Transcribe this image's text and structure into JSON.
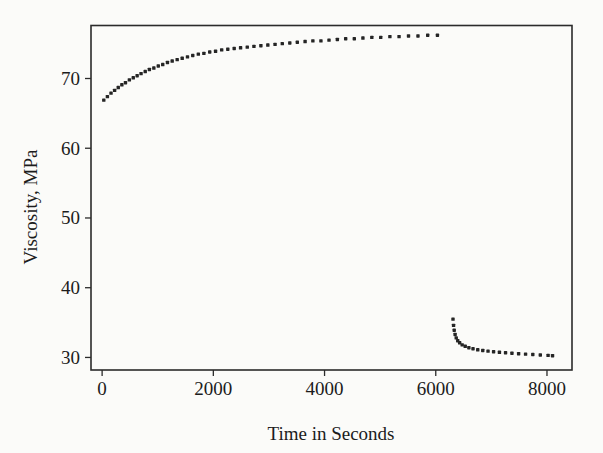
{
  "figure": {
    "background_color": "#fbfbf9",
    "ink_color": "#252525"
  },
  "chart_data": {
    "type": "scatter",
    "title": "",
    "xlabel": "Time in Seconds",
    "ylabel": "Viscosity, MPa",
    "xlim": [
      -200,
      8450
    ],
    "ylim": [
      28.2,
      77.6
    ],
    "xticks": [
      0,
      2000,
      4000,
      6000,
      8000
    ],
    "xtick_labels": [
      "0",
      "2000",
      "4000",
      "6000",
      "8000"
    ],
    "yticks": [
      30,
      40,
      50,
      60,
      70
    ],
    "ytick_labels": [
      "30",
      "40",
      "50",
      "60",
      "70"
    ],
    "grid": false,
    "legend": false,
    "marker": "square-dot",
    "series": [
      {
        "name": "rising-branch",
        "points": [
          [
            30,
            66.9
          ],
          [
            95,
            67.4
          ],
          [
            160,
            67.9
          ],
          [
            225,
            68.3
          ],
          [
            290,
            68.7
          ],
          [
            355,
            69.1
          ],
          [
            420,
            69.4
          ],
          [
            490,
            69.8
          ],
          [
            560,
            70.1
          ],
          [
            630,
            70.4
          ],
          [
            700,
            70.7
          ],
          [
            775,
            71.0
          ],
          [
            850,
            71.3
          ],
          [
            930,
            71.5
          ],
          [
            1010,
            71.8
          ],
          [
            1090,
            72.0
          ],
          [
            1175,
            72.3
          ],
          [
            1260,
            72.5
          ],
          [
            1350,
            72.7
          ],
          [
            1440,
            72.9
          ],
          [
            1535,
            73.1
          ],
          [
            1630,
            73.3
          ],
          [
            1730,
            73.5
          ],
          [
            1830,
            73.6
          ],
          [
            1935,
            73.8
          ],
          [
            2040,
            73.9
          ],
          [
            2150,
            74.1
          ],
          [
            2260,
            74.2
          ],
          [
            2375,
            74.3
          ],
          [
            2490,
            74.4
          ],
          [
            2610,
            74.5
          ],
          [
            2730,
            74.6
          ],
          [
            2855,
            74.7
          ],
          [
            2980,
            74.8
          ],
          [
            3110,
            74.9
          ],
          [
            3240,
            75.0
          ],
          [
            3375,
            75.1
          ],
          [
            3510,
            75.2
          ],
          [
            3650,
            75.3
          ],
          [
            3790,
            75.4
          ],
          [
            3935,
            75.4
          ],
          [
            4080,
            75.5
          ],
          [
            4230,
            75.6
          ],
          [
            4380,
            75.7
          ],
          [
            4535,
            75.7
          ],
          [
            4690,
            75.8
          ],
          [
            4850,
            75.9
          ],
          [
            5010,
            75.9
          ],
          [
            5175,
            76.0
          ],
          [
            5340,
            76.0
          ],
          [
            5510,
            76.1
          ],
          [
            5680,
            76.1
          ],
          [
            5855,
            76.2
          ],
          [
            6030,
            76.2
          ]
        ]
      },
      {
        "name": "falling-branch",
        "points": [
          [
            6310,
            35.5
          ],
          [
            6320,
            34.6
          ],
          [
            6332,
            33.9
          ],
          [
            6348,
            33.3
          ],
          [
            6368,
            32.8
          ],
          [
            6395,
            32.4
          ],
          [
            6430,
            32.1
          ],
          [
            6475,
            31.8
          ],
          [
            6530,
            31.6
          ],
          [
            6595,
            31.4
          ],
          [
            6670,
            31.25
          ],
          [
            6755,
            31.1
          ],
          [
            6845,
            31.0
          ],
          [
            6940,
            30.9
          ],
          [
            7040,
            30.82
          ],
          [
            7145,
            30.74
          ],
          [
            7255,
            30.67
          ],
          [
            7370,
            30.6
          ],
          [
            7490,
            30.54
          ],
          [
            7615,
            30.48
          ],
          [
            7745,
            30.42
          ],
          [
            7880,
            30.36
          ],
          [
            8020,
            30.3
          ],
          [
            8100,
            30.25
          ]
        ]
      }
    ]
  }
}
